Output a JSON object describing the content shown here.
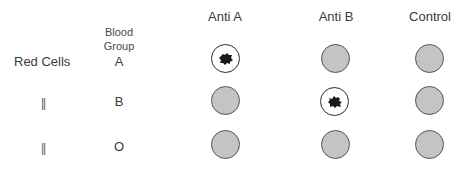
{
  "columns": [
    {
      "label": "Anti A",
      "center_x": 225
    },
    {
      "label": "Anti B",
      "center_x": 336
    },
    {
      "label": "Control",
      "center_x": 430
    }
  ],
  "blood_group_header": {
    "line1": "Blood",
    "line2": "Group"
  },
  "row_label": "Red Cells",
  "ditto_mark": "||",
  "rows": [
    {
      "group": "A",
      "results": [
        "agglutinated",
        "no-agglutination",
        "no-agglutination"
      ]
    },
    {
      "group": "B",
      "results": [
        "no-agglutination",
        "agglutinated",
        "no-agglutination"
      ]
    },
    {
      "group": "O",
      "results": [
        "no-agglutination",
        "no-agglutination",
        "no-agglutination"
      ]
    }
  ],
  "colors": {
    "negative_fill": "#c4c4c4",
    "outline": "#555555",
    "positive_fill": "#ffffff",
    "clump": "#1a1a1a",
    "text": "#3a3a3a"
  }
}
